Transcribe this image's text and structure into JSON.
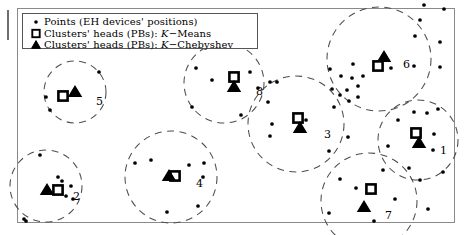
{
  "figure": {
    "title": "",
    "background_color": "#ffffff",
    "frame_color": "#7a7a7a",
    "marker_color": "#000000",
    "circle_color": "#4d4d4d"
  },
  "legend": {
    "position": "top-left",
    "entries": [
      {
        "marker": "point-marker",
        "label": "Points (EH devices' positions)"
      },
      {
        "marker": "square-marker",
        "label_prefix": "Clusters' heads (PBs): ",
        "label_italic": "K",
        "label_suffix": "−Means",
        "label": "Clusters' heads (PBs): K−Means"
      },
      {
        "marker": "triangle-marker",
        "label_prefix": "Clusters' heads (PBs): ",
        "label_italic": "K",
        "label_suffix": "−Chebyshev",
        "label": "Clusters' heads (PBs): K−Chebyshev"
      }
    ]
  },
  "chart_data": {
    "type": "scatter",
    "title": "",
    "xlabel": "",
    "ylabel": "",
    "xlim": [
      0,
      464
    ],
    "ylim": [
      0,
      235
    ],
    "grid": false,
    "legend_position": "upper left",
    "clusters": [
      {
        "id": "1",
        "label": "1",
        "label_pos": [
          440,
          152
        ],
        "circle": {
          "cx": 418,
          "cy": 140,
          "r": 40
        },
        "kmeans_head": [
          416,
          133
        ],
        "kchebyshev_head": [
          419,
          143
        ],
        "points": [
          [
            398,
            120
          ],
          [
            434,
            134
          ],
          [
            433,
            150
          ],
          [
            414,
            112
          ],
          [
            427,
            113
          ],
          [
            438,
            109
          ],
          [
            388,
            146
          ],
          [
            409,
            168
          ],
          [
            443,
            172
          ]
        ]
      },
      {
        "id": "2",
        "label": "2",
        "label_pos": [
          73,
          198
        ],
        "circle": {
          "cx": 46,
          "cy": 186,
          "r": 36
        },
        "kmeans_head": [
          58,
          190
        ],
        "kchebyshev_head": [
          47,
          190
        ],
        "points": [
          [
            40,
            155
          ],
          [
            58,
            177
          ],
          [
            62,
            181
          ],
          [
            71,
            186
          ],
          [
            66,
            196
          ],
          [
            73,
            199
          ],
          [
            24,
            219
          ],
          [
            26,
            221
          ]
        ]
      },
      {
        "id": "3",
        "label": "3",
        "label_pos": [
          324,
          136
        ],
        "circle": {
          "cx": 296,
          "cy": 124,
          "r": 48
        },
        "kmeans_head": [
          298,
          118
        ],
        "kchebyshev_head": [
          300,
          128
        ],
        "points": [
          [
            306,
            120
          ],
          [
            272,
            124
          ],
          [
            270,
            136
          ],
          [
            268,
            102
          ],
          [
            277,
            82
          ],
          [
            334,
            107
          ],
          [
            329,
            151
          ],
          [
            348,
            137
          ],
          [
            270,
            82
          ]
        ]
      },
      {
        "id": "4",
        "label": "4",
        "label_pos": [
          196,
          185
        ],
        "circle": {
          "cx": 171,
          "cy": 177,
          "r": 46
        },
        "kmeans_head": [
          175,
          176
        ],
        "kchebyshev_head": [
          169,
          176
        ],
        "points": [
          [
            151,
            160
          ],
          [
            135,
            163
          ],
          [
            189,
            165
          ],
          [
            204,
            163
          ],
          [
            203,
            177
          ],
          [
            167,
            212
          ],
          [
            198,
            206
          ]
        ]
      },
      {
        "id": "5",
        "label": "5",
        "label_pos": [
          96,
          103
        ],
        "circle": {
          "cx": 75,
          "cy": 92,
          "r": 31
        },
        "kmeans_head": [
          63,
          96
        ],
        "kchebyshev_head": [
          75,
          92
        ],
        "points": [
          [
            46,
            97
          ],
          [
            50,
            110
          ],
          [
            99,
            72
          ]
        ]
      },
      {
        "id": "6",
        "label": "6",
        "label_pos": [
          403,
          66
        ],
        "circle": {
          "cx": 379,
          "cy": 59,
          "r": 52
        },
        "kmeans_head": [
          378,
          66
        ],
        "kchebyshev_head": [
          384,
          57
        ],
        "points": [
          [
            420,
            20
          ],
          [
            415,
            36
          ],
          [
            353,
            64
          ],
          [
            391,
            68
          ],
          [
            414,
            66
          ],
          [
            440,
            67
          ],
          [
            330,
            69
          ],
          [
            440,
            42
          ],
          [
            444,
            9
          ],
          [
            424,
            5
          ]
        ]
      },
      {
        "id": "7",
        "label": "7",
        "label_pos": [
          385,
          217
        ],
        "circle": {
          "cx": 369,
          "cy": 201,
          "r": 48
        },
        "kmeans_head": [
          371,
          189
        ],
        "kchebyshev_head": [
          364,
          207
        ],
        "points": [
          [
            356,
            188
          ],
          [
            383,
            170
          ],
          [
            395,
            199
          ],
          [
            420,
            180
          ],
          [
            428,
            209
          ],
          [
            374,
            221
          ],
          [
            329,
            213
          ],
          [
            340,
            179
          ]
        ]
      },
      {
        "id": "8",
        "label": "8",
        "label_pos": [
          256,
          93
        ],
        "circle": {
          "cx": 224,
          "cy": 83,
          "r": 40
        },
        "kmeans_head": [
          234,
          77
        ],
        "kchebyshev_head": [
          234,
          87
        ],
        "points": [
          [
            212,
            80
          ],
          [
            196,
            68
          ],
          [
            192,
            107
          ],
          [
            250,
            72
          ],
          [
            258,
            88
          ],
          [
            241,
            115
          ]
        ]
      },
      {
        "id": "dense-mid-right",
        "label": "",
        "label_pos": null,
        "circle": null,
        "kmeans_head": null,
        "kchebyshev_head": null,
        "points": [
          [
            341,
            76
          ],
          [
            352,
            78
          ],
          [
            358,
            86
          ],
          [
            347,
            90
          ],
          [
            340,
            95
          ],
          [
            358,
            97
          ],
          [
            363,
            76
          ],
          [
            332,
            89
          ],
          [
            349,
            101
          ]
        ]
      }
    ]
  }
}
